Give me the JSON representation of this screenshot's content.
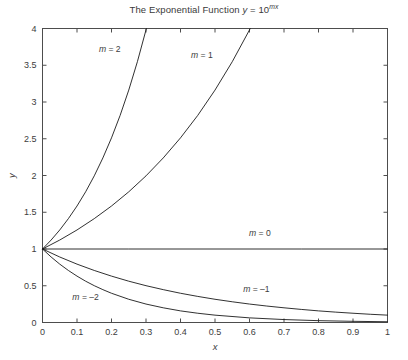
{
  "chart_data": {
    "type": "line",
    "title_prefix": "The Exponential Function ",
    "title_var_y": "y",
    "title_eq": " = 10",
    "title_exp": "mx",
    "xlabel": "x",
    "ylabel": "y",
    "xlim": [
      0,
      1
    ],
    "ylim": [
      0,
      4
    ],
    "grid": false,
    "legend_position": "inline-annotations",
    "xticks": [
      0,
      0.1,
      0.2,
      0.3,
      0.4,
      0.5,
      0.6,
      0.7,
      0.8,
      0.9,
      1
    ],
    "xtick_labels": [
      "0",
      "0.1",
      "0.2",
      "0.3",
      "0.4",
      "0.5",
      "0.6",
      "0.7",
      "0.8",
      "0.9",
      "1"
    ],
    "yticks": [
      0,
      0.5,
      1,
      1.5,
      2,
      2.5,
      3,
      3.5,
      4
    ],
    "ytick_labels": [
      "0",
      "0.5",
      "1",
      "1.5",
      "2",
      "2.5",
      "3",
      "3.5",
      "4"
    ],
    "line_color": "#1a1a1a",
    "axis_color": "#4d4d4d",
    "background": "#ffffff",
    "series": [
      {
        "name": "m = 2",
        "m": 2,
        "label_text_lead": "m",
        "label_text_rest": " = 2",
        "label_x": 0.195,
        "label_y": 3.68,
        "x": [
          0,
          0.025,
          0.05,
          0.075,
          0.1,
          0.125,
          0.15,
          0.175,
          0.2,
          0.225,
          0.25,
          0.275,
          0.3,
          0.30103
        ],
        "y": [
          1,
          1.122,
          1.259,
          1.413,
          1.585,
          1.778,
          1.995,
          2.239,
          2.512,
          2.818,
          3.162,
          3.548,
          3.981,
          4
        ]
      },
      {
        "name": "m = 1",
        "m": 1,
        "label_text_lead": "m",
        "label_text_rest": " = 1",
        "label_x": 0.462,
        "label_y": 3.6,
        "x": [
          0,
          0.05,
          0.1,
          0.15,
          0.2,
          0.25,
          0.3,
          0.35,
          0.4,
          0.45,
          0.5,
          0.55,
          0.6,
          0.60206
        ],
        "y": [
          1,
          1.122,
          1.259,
          1.413,
          1.585,
          1.778,
          1.995,
          2.239,
          2.512,
          2.818,
          3.162,
          3.548,
          3.981,
          4
        ]
      },
      {
        "name": "m = 0",
        "m": 0,
        "label_text_lead": "m",
        "label_text_rest": " = 0",
        "label_x": 0.63,
        "label_y": 1.18,
        "x": [
          0,
          0.25,
          0.5,
          0.75,
          1
        ],
        "y": [
          1,
          1,
          1,
          1,
          1
        ]
      },
      {
        "name": "m = -1",
        "m": -1,
        "label_text_lead": "m",
        "label_text_rest": " = –1",
        "label_x": 0.62,
        "label_y": 0.42,
        "x": [
          0,
          0.05,
          0.1,
          0.15,
          0.2,
          0.25,
          0.3,
          0.35,
          0.4,
          0.45,
          0.5,
          0.55,
          0.6,
          0.65,
          0.7,
          0.75,
          0.8,
          0.85,
          0.9,
          0.95,
          1
        ],
        "y": [
          1,
          0.891,
          0.794,
          0.708,
          0.631,
          0.562,
          0.501,
          0.447,
          0.398,
          0.355,
          0.316,
          0.282,
          0.251,
          0.224,
          0.2,
          0.178,
          0.158,
          0.141,
          0.126,
          0.112,
          0.1
        ]
      },
      {
        "name": "m = -2",
        "m": -2,
        "label_text_lead": "m",
        "label_text_rest": " = –2",
        "label_x": 0.125,
        "label_y": 0.3,
        "x": [
          0,
          0.025,
          0.05,
          0.075,
          0.1,
          0.125,
          0.15,
          0.175,
          0.2,
          0.25,
          0.3,
          0.35,
          0.4,
          0.45,
          0.5,
          0.6,
          0.7,
          0.8,
          0.9,
          1
        ],
        "y": [
          1,
          0.891,
          0.794,
          0.708,
          0.631,
          0.562,
          0.501,
          0.447,
          0.398,
          0.316,
          0.251,
          0.2,
          0.158,
          0.126,
          0.1,
          0.063,
          0.04,
          0.025,
          0.016,
          0.01
        ]
      }
    ]
  }
}
